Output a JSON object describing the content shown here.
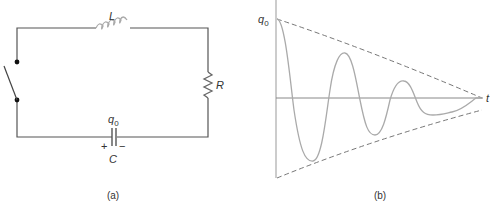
{
  "figure_a": {
    "caption": "(a)",
    "inductor_label": "L",
    "resistor_label": "R",
    "capacitor_label": "C",
    "charge_label": "q",
    "charge_subscript": "0",
    "plus_sign": "+",
    "minus_sign": "−",
    "components": [
      "switch",
      "inductor",
      "resistor",
      "capacitor"
    ]
  },
  "figure_b": {
    "caption": "(b)",
    "y_axis_label": "q",
    "y_axis_subscript": "0",
    "x_axis_label": "t",
    "curve": "damped-oscillation",
    "envelope": "dashed-exponential-decay"
  },
  "colors": {
    "wire": "#555555",
    "component": "#999999",
    "curve": "#aaaaaa",
    "envelope": "#777777",
    "text": "#333333"
  }
}
